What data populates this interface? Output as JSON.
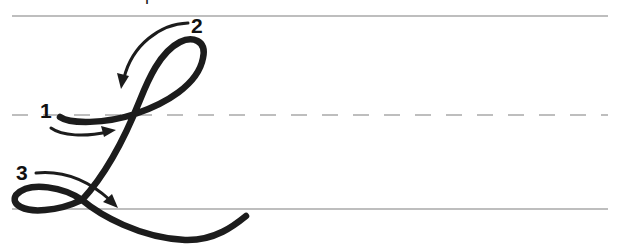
{
  "diagram": {
    "title_cropped": "Cursive capital L stroke order",
    "letter": "L",
    "colors": {
      "ink": "#1c1c1c",
      "guide_line": "#a9a9a9",
      "background": "#ffffff"
    },
    "guide_lines": {
      "top_y": 16,
      "mid_dashed_y": 115,
      "baseline_y": 209,
      "x_start": 12,
      "x_end": 608
    },
    "steps": [
      {
        "number": "1",
        "description": "Start at midline, stroke right and up into loop"
      },
      {
        "number": "2",
        "description": "Loop over the top and come down"
      },
      {
        "number": "3",
        "description": "Make small loop at baseline and swing right"
      }
    ]
  }
}
